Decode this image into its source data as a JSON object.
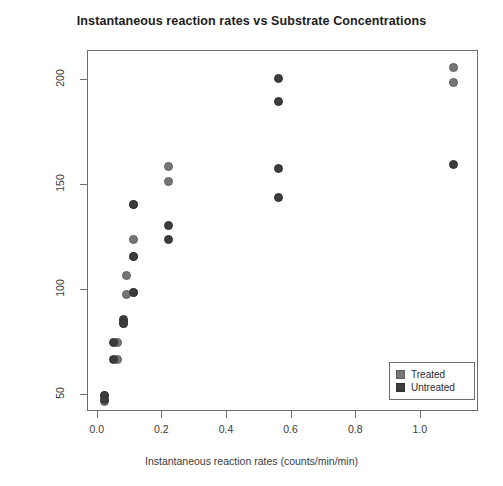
{
  "chart_data": {
    "type": "scatter",
    "title": "Instantaneous reaction rates vs Substrate Concentrations",
    "xlabel": "Instantaneous reaction rates (counts/min/min)",
    "ylabel": "Substrate Concentrations (ppm)",
    "xlim": [
      -0.03,
      1.18
    ],
    "ylim": [
      42,
      214
    ],
    "xticks": [
      "0.0",
      "0.2",
      "0.4",
      "0.6",
      "0.8",
      "1.0"
    ],
    "xtick_values": [
      0.0,
      0.2,
      0.4,
      0.6,
      0.8,
      1.0
    ],
    "yticks": [
      "50",
      "100",
      "150",
      "200"
    ],
    "ytick_values": [
      50,
      100,
      150,
      200
    ],
    "grid": false,
    "legend_position": "bottom-right",
    "series": [
      {
        "name": "Treated",
        "color": "#767676",
        "marker": "circle",
        "points": [
          {
            "x": 0.02,
            "y": 50
          },
          {
            "x": 0.02,
            "y": 47
          },
          {
            "x": 0.06,
            "y": 75
          },
          {
            "x": 0.06,
            "y": 67
          },
          {
            "x": 0.08,
            "y": 85
          },
          {
            "x": 0.08,
            "y": 84
          },
          {
            "x": 0.09,
            "y": 107
          },
          {
            "x": 0.09,
            "y": 98
          },
          {
            "x": 0.11,
            "y": 141
          },
          {
            "x": 0.11,
            "y": 124
          },
          {
            "x": 0.11,
            "y": 116
          },
          {
            "x": 0.11,
            "y": 99
          },
          {
            "x": 0.22,
            "y": 159
          },
          {
            "x": 0.22,
            "y": 152
          },
          {
            "x": 1.1,
            "y": 206
          },
          {
            "x": 1.1,
            "y": 199
          }
        ]
      },
      {
        "name": "Untreated",
        "color": "#3c3c3c",
        "marker": "circle",
        "points": [
          {
            "x": 0.02,
            "y": 50
          },
          {
            "x": 0.02,
            "y": 48
          },
          {
            "x": 0.05,
            "y": 75
          },
          {
            "x": 0.05,
            "y": 67
          },
          {
            "x": 0.08,
            "y": 86
          },
          {
            "x": 0.08,
            "y": 84
          },
          {
            "x": 0.11,
            "y": 141
          },
          {
            "x": 0.11,
            "y": 116
          },
          {
            "x": 0.11,
            "y": 99
          },
          {
            "x": 0.22,
            "y": 131
          },
          {
            "x": 0.22,
            "y": 124
          },
          {
            "x": 0.56,
            "y": 201
          },
          {
            "x": 0.56,
            "y": 190
          },
          {
            "x": 0.56,
            "y": 158
          },
          {
            "x": 0.56,
            "y": 144
          },
          {
            "x": 1.1,
            "y": 160
          }
        ]
      }
    ]
  },
  "legend": {
    "items": [
      {
        "label": "Treated",
        "key": "treated"
      },
      {
        "label": "Untreated",
        "key": "untreated"
      }
    ]
  }
}
